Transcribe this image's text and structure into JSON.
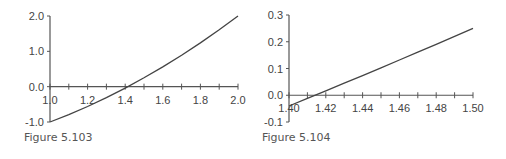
{
  "chart_data": [
    {
      "type": "line",
      "title": "",
      "caption": "Figure 5.103",
      "xlabel": "",
      "ylabel": "",
      "xlim": [
        1.0,
        2.0
      ],
      "ylim": [
        -1.0,
        2.0
      ],
      "x_ticks": [
        "1.0",
        "1.2",
        "1.4",
        "1.6",
        "1.8",
        "2.0"
      ],
      "y_ticks": [
        "2.0",
        "1.0",
        "0.0",
        "-1.0"
      ],
      "grid": false,
      "legend": null,
      "series": [
        {
          "name": "f(x) = x^2 - 2",
          "x": [
            1.0,
            1.1,
            1.2,
            1.3,
            1.4,
            1.5,
            1.6,
            1.7,
            1.8,
            1.9,
            2.0
          ],
          "y": [
            -1.0,
            -0.79,
            -0.56,
            -0.31,
            -0.04,
            0.25,
            0.56,
            0.89,
            1.24,
            1.61,
            2.0
          ]
        }
      ]
    },
    {
      "type": "line",
      "title": "",
      "caption": "Figure 5.104",
      "xlabel": "",
      "ylabel": "",
      "xlim": [
        1.4,
        1.5
      ],
      "ylim": [
        -0.1,
        0.3
      ],
      "x_ticks": [
        "1.40",
        "1.42",
        "1.44",
        "1.46",
        "1.48",
        "1.50"
      ],
      "y_ticks": [
        "0.3",
        "0.2",
        "0.1",
        "0.0",
        "-0.1"
      ],
      "grid": false,
      "legend": null,
      "series": [
        {
          "name": "f(x) = x^2 - 2",
          "x": [
            1.4,
            1.41,
            1.42,
            1.43,
            1.44,
            1.45,
            1.46,
            1.47,
            1.48,
            1.49,
            1.5
          ],
          "y": [
            -0.04,
            -0.0119,
            0.0164,
            0.0449,
            0.0736,
            0.1025,
            0.1316,
            0.1609,
            0.1904,
            0.2201,
            0.25
          ]
        }
      ]
    }
  ],
  "figures": {
    "left": {
      "caption": "Figure 5.103"
    },
    "right": {
      "caption": "Figure 5.104"
    }
  }
}
